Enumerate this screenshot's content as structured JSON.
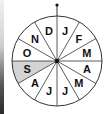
{
  "diagram": {
    "type": "month-wheel",
    "sectors": [
      {
        "label": "J",
        "shaded": false
      },
      {
        "label": "F",
        "shaded": false
      },
      {
        "label": "M",
        "shaded": false
      },
      {
        "label": "A",
        "shaded": false
      },
      {
        "label": "M",
        "shaded": false
      },
      {
        "label": "J",
        "shaded": false
      },
      {
        "label": "J",
        "shaded": false
      },
      {
        "label": "A",
        "shaded": false
      },
      {
        "label": "S",
        "shaded": true
      },
      {
        "label": "O",
        "shaded": false
      },
      {
        "label": "N",
        "shaded": false
      },
      {
        "label": "D",
        "shaded": false
      }
    ],
    "start_marker": "top-dot",
    "direction": "clockwise",
    "colors": {
      "stroke": "#333333",
      "shade": "#d4d4d4",
      "text": "#111111",
      "background": "#ffffff"
    }
  }
}
